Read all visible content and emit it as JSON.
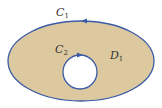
{
  "diagram": {
    "outer_curve": {
      "label": "C",
      "subscript": "1",
      "color": "#3b5ba5"
    },
    "inner_curve": {
      "label": "C",
      "subscript": "2",
      "color": "#3b5ba5"
    },
    "region": {
      "label": "D",
      "subscript": "1",
      "fill": "#dcc9a0"
    },
    "hole_fill": "#ffffff"
  }
}
